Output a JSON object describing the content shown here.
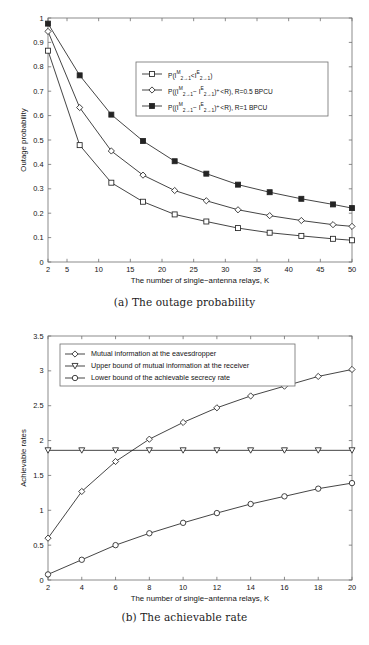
{
  "figure_a": {
    "caption": "(a) The outage probability",
    "chart_data": {
      "type": "line",
      "title": "",
      "xlabel": "The number of single−antenna relays, K",
      "ylabel": "Outage probability",
      "xlim": [
        2,
        50
      ],
      "ylim": [
        0,
        1
      ],
      "xticks": [
        2,
        5,
        10,
        15,
        20,
        25,
        30,
        35,
        40,
        45,
        50
      ],
      "yticks": [
        0,
        0.1,
        0.2,
        0.3,
        0.4,
        0.5,
        0.6,
        0.7,
        0.8,
        0.9,
        1
      ],
      "grid": false,
      "legend_position": "upper-center",
      "x": [
        2,
        7,
        12,
        17,
        22,
        27,
        32,
        37,
        42,
        47,
        50
      ],
      "series": [
        {
          "name": "P(I^M_{2→1} < I^E_{2→1})",
          "marker": "square-open",
          "values": [
            0.866,
            0.479,
            0.325,
            0.247,
            0.195,
            0.166,
            0.139,
            0.12,
            0.107,
            0.095,
            0.089
          ]
        },
        {
          "name": "P((I^M_{2→1} − I^E_{2→1})^+ < R), R=0.5 BPCU",
          "marker": "diamond-open",
          "values": [
            0.945,
            0.633,
            0.455,
            0.356,
            0.293,
            0.251,
            0.214,
            0.19,
            0.17,
            0.153,
            0.146
          ]
        },
        {
          "name": "P((I^M_{2→1} − I^E_{2→1})^+ < R),  R=1 BPCU",
          "marker": "square-filled",
          "values": [
            0.977,
            0.765,
            0.604,
            0.496,
            0.413,
            0.362,
            0.317,
            0.286,
            0.259,
            0.236,
            0.221
          ]
        }
      ]
    },
    "legend": [
      {
        "prefix": "P(I",
        "sup1": "M",
        "sub1": "2→1",
        "mid": "<I",
        "sup2": "E",
        "sub2": "2→1",
        "suffix": ")",
        "marker": "square-open"
      },
      {
        "prefix": "P((I",
        "sup1": "M",
        "sub1": "2→1",
        "mid": "− I",
        "sup2": "E",
        "sub2": "2→1",
        "suffix": ")⁺<R), R=0.5 BPCU",
        "marker": "diamond-open"
      },
      {
        "prefix": "P((I",
        "sup1": "M",
        "sub1": "2→1",
        "mid": "− I",
        "sup2": "E",
        "sub2": "2→1",
        "suffix": ")⁺<R),  R=1 BPCU",
        "marker": "square-filled"
      }
    ]
  },
  "figure_b": {
    "caption": "(b) The achievable rate",
    "chart_data": {
      "type": "line",
      "title": "",
      "xlabel": "The number of single−antenna relays, K",
      "ylabel": "Achievable rates",
      "xlim": [
        2,
        20
      ],
      "ylim": [
        0,
        3.5
      ],
      "xticks": [
        2,
        4,
        6,
        8,
        10,
        12,
        14,
        16,
        18,
        20
      ],
      "yticks": [
        0,
        0.5,
        1,
        1.5,
        2,
        2.5,
        3,
        3.5
      ],
      "grid": false,
      "legend_position": "upper-left",
      "x": [
        2,
        4,
        6,
        8,
        10,
        12,
        14,
        16,
        18,
        20
      ],
      "series": [
        {
          "name": "Mutual information at the eavesdropper",
          "marker": "diamond-open",
          "values": [
            0.6,
            1.27,
            1.7,
            2.02,
            2.26,
            2.47,
            2.64,
            2.78,
            2.92,
            3.02
          ]
        },
        {
          "name": "Upper bound of mutual information at the receiver",
          "marker": "triangle-down-open",
          "values": [
            1.86,
            1.86,
            1.86,
            1.86,
            1.86,
            1.86,
            1.86,
            1.86,
            1.86,
            1.86
          ]
        },
        {
          "name": "Lower bound of the achievable secrecy rate",
          "marker": "circle-open",
          "values": [
            0.08,
            0.29,
            0.5,
            0.67,
            0.82,
            0.96,
            1.09,
            1.2,
            1.31,
            1.39
          ]
        }
      ]
    }
  }
}
